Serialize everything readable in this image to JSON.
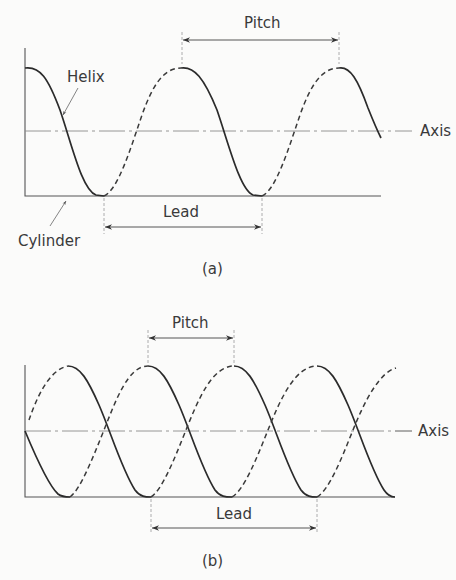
{
  "figure_a": {
    "caption": "(a)",
    "labels": {
      "pitch": "Pitch",
      "lead": "Lead",
      "helix": "Helix",
      "cylinder": "Cylinder",
      "axis": "Axis"
    }
  },
  "figure_b": {
    "caption": "(b)",
    "labels": {
      "pitch": "Pitch",
      "lead": "Lead",
      "axis": "Axis"
    }
  },
  "colors": {
    "background": "#fbfbfa",
    "line": "#2b2b2b",
    "text": "#3a3a3a"
  }
}
